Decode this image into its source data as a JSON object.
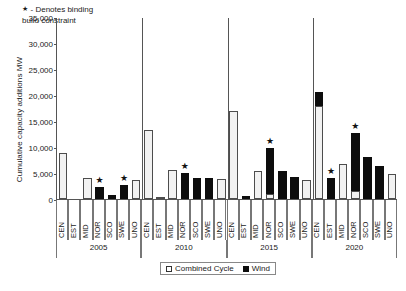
{
  "chart_data": {
    "type": "bar",
    "stacked": true,
    "title": "",
    "xlabel": "",
    "ylabel": "Cumulative capacity additions MW",
    "ylim": [
      0,
      35000
    ],
    "ytick_labels": [
      "35,000",
      "30,000",
      "25,000",
      "20,000",
      "15,000",
      "10,000",
      "5,000",
      "0"
    ],
    "ytick_values": [
      35000,
      30000,
      25000,
      20000,
      15000,
      10000,
      5000,
      0
    ],
    "grid": false,
    "legend_position": "bottom-center",
    "annotation": {
      "marker": "★",
      "text_line1": "- Denotes binding",
      "text_line2": "build constraint"
    },
    "series": [
      {
        "name": "Combined Cycle",
        "color": "#f2f2f2"
      },
      {
        "name": "Wind",
        "color": "#0d0d0d"
      }
    ],
    "groups": [
      "2005",
      "2010",
      "2015",
      "2020"
    ],
    "categories": [
      "CEN",
      "EST",
      "MID",
      "NOR",
      "SCO",
      "SWE",
      "UNO"
    ],
    "points": [
      {
        "group": "2005",
        "category": "CEN",
        "combined_cycle": 8900,
        "wind": 0,
        "binding": false
      },
      {
        "group": "2005",
        "category": "EST",
        "combined_cycle": 0,
        "wind": 0,
        "binding": false
      },
      {
        "group": "2005",
        "category": "MID",
        "combined_cycle": 4100,
        "wind": 0,
        "binding": false
      },
      {
        "group": "2005",
        "category": "NOR",
        "combined_cycle": 0,
        "wind": 2400,
        "binding": true
      },
      {
        "group": "2005",
        "category": "SCO",
        "combined_cycle": 0,
        "wind": 800,
        "binding": false
      },
      {
        "group": "2005",
        "category": "SWE",
        "combined_cycle": 0,
        "wind": 2700,
        "binding": true
      },
      {
        "group": "2005",
        "category": "UNO",
        "combined_cycle": 3700,
        "wind": 0,
        "binding": false
      },
      {
        "group": "2010",
        "category": "CEN",
        "combined_cycle": 13300,
        "wind": 0,
        "binding": false
      },
      {
        "group": "2010",
        "category": "EST",
        "combined_cycle": 400,
        "wind": 0,
        "binding": false
      },
      {
        "group": "2010",
        "category": "MID",
        "combined_cycle": 5600,
        "wind": 0,
        "binding": false
      },
      {
        "group": "2010",
        "category": "NOR",
        "combined_cycle": 0,
        "wind": 5000,
        "binding": true
      },
      {
        "group": "2010",
        "category": "SCO",
        "combined_cycle": 0,
        "wind": 4100,
        "binding": false
      },
      {
        "group": "2010",
        "category": "SWE",
        "combined_cycle": 0,
        "wind": 4100,
        "binding": false
      },
      {
        "group": "2010",
        "category": "UNO",
        "combined_cycle": 3800,
        "wind": 0,
        "binding": false
      },
      {
        "group": "2015",
        "category": "CEN",
        "combined_cycle": 17000,
        "wind": 0,
        "binding": false
      },
      {
        "group": "2015",
        "category": "EST",
        "combined_cycle": 0,
        "wind": 600,
        "binding": false
      },
      {
        "group": "2015",
        "category": "MID",
        "combined_cycle": 5400,
        "wind": 0,
        "binding": false
      },
      {
        "group": "2015",
        "category": "NOR",
        "combined_cycle": 1000,
        "wind": 8800,
        "binding": true
      },
      {
        "group": "2015",
        "category": "SCO",
        "combined_cycle": 0,
        "wind": 5400,
        "binding": false
      },
      {
        "group": "2015",
        "category": "SWE",
        "combined_cycle": 0,
        "wind": 4200,
        "binding": false
      },
      {
        "group": "2015",
        "category": "UNO",
        "combined_cycle": 3600,
        "wind": 0,
        "binding": false
      },
      {
        "group": "2020",
        "category": "CEN",
        "combined_cycle": 17800,
        "wind": 2700,
        "binding": false
      },
      {
        "group": "2020",
        "category": "EST",
        "combined_cycle": 0,
        "wind": 4100,
        "binding": true
      },
      {
        "group": "2020",
        "category": "MID",
        "combined_cycle": 6800,
        "wind": 0,
        "binding": false
      },
      {
        "group": "2020",
        "category": "NOR",
        "combined_cycle": 1500,
        "wind": 11100,
        "binding": true
      },
      {
        "group": "2020",
        "category": "SCO",
        "combined_cycle": 0,
        "wind": 8000,
        "binding": false
      },
      {
        "group": "2020",
        "category": "SWE",
        "combined_cycle": 0,
        "wind": 6300,
        "binding": false
      },
      {
        "group": "2020",
        "category": "UNO",
        "combined_cycle": 4800,
        "wind": 0,
        "binding": false
      }
    ]
  },
  "legend": {
    "items": [
      {
        "label": "Combined Cycle",
        "swatch": "cc"
      },
      {
        "label": "Wind",
        "swatch": "wind"
      }
    ]
  }
}
